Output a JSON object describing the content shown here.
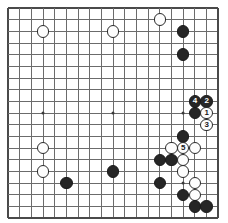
{
  "diagram": {
    "board_size": 19,
    "geometry": {
      "origin_x": 8,
      "origin_y": 8,
      "spacing": 11.67,
      "stone_radius": 6.2,
      "line_color": "#6b6b6b",
      "edge_color": "#4a4a4a",
      "board_color": "#ffffff",
      "black_color": "#262626",
      "white_color": "#fdfdfd",
      "hoshi_color": "#3a3a3a"
    },
    "hoshi_points": [
      {
        "col": 3,
        "row": 9
      },
      {
        "col": 9,
        "row": 9
      },
      {
        "col": 15,
        "row": 9
      },
      {
        "col": 15,
        "row": 15
      }
    ],
    "stones": [
      {
        "id": "s1",
        "color": "black",
        "col": 15,
        "row": 2,
        "label": ""
      },
      {
        "id": "s2",
        "color": "black",
        "col": 15,
        "row": 4,
        "label": ""
      },
      {
        "id": "s3",
        "color": "white",
        "col": 13,
        "row": 1,
        "label": ""
      },
      {
        "id": "s4",
        "color": "white",
        "col": 3,
        "row": 2,
        "label": ""
      },
      {
        "id": "s5",
        "color": "white",
        "col": 9,
        "row": 2,
        "label": ""
      },
      {
        "id": "s6",
        "color": "black",
        "col": 16,
        "row": 8,
        "label": "4"
      },
      {
        "id": "s7",
        "color": "black",
        "col": 17,
        "row": 8,
        "label": "2"
      },
      {
        "id": "s8",
        "color": "black",
        "col": 16,
        "row": 9,
        "label": ""
      },
      {
        "id": "s9",
        "color": "white",
        "col": 17,
        "row": 9,
        "label": "1"
      },
      {
        "id": "s10",
        "color": "white",
        "col": 17,
        "row": 10,
        "label": "3"
      },
      {
        "id": "s11",
        "color": "black",
        "col": 15,
        "row": 11,
        "label": ""
      },
      {
        "id": "s12",
        "color": "white",
        "col": 14,
        "row": 12,
        "label": ""
      },
      {
        "id": "s13",
        "color": "white",
        "col": 15,
        "row": 12,
        "label": "5"
      },
      {
        "id": "s14",
        "color": "white",
        "col": 16,
        "row": 12,
        "label": ""
      },
      {
        "id": "s15",
        "color": "black",
        "col": 13,
        "row": 13,
        "label": ""
      },
      {
        "id": "s16",
        "color": "black",
        "col": 14,
        "row": 13,
        "label": ""
      },
      {
        "id": "s17",
        "color": "white",
        "col": 15,
        "row": 13,
        "label": ""
      },
      {
        "id": "s18",
        "color": "white",
        "col": 15,
        "row": 14,
        "label": ""
      },
      {
        "id": "s19",
        "color": "black",
        "col": 13,
        "row": 15,
        "label": ""
      },
      {
        "id": "s20",
        "color": "white",
        "col": 16,
        "row": 15,
        "label": ""
      },
      {
        "id": "s21",
        "color": "black",
        "col": 15,
        "row": 16,
        "label": ""
      },
      {
        "id": "s22",
        "color": "white",
        "col": 16,
        "row": 16,
        "label": ""
      },
      {
        "id": "s23",
        "color": "black",
        "col": 16,
        "row": 17,
        "label": ""
      },
      {
        "id": "s24",
        "color": "black",
        "col": 17,
        "row": 17,
        "label": ""
      },
      {
        "id": "s25",
        "color": "white",
        "col": 3,
        "row": 12,
        "label": ""
      },
      {
        "id": "s26",
        "color": "white",
        "col": 3,
        "row": 14,
        "label": ""
      },
      {
        "id": "s27",
        "color": "black",
        "col": 5,
        "row": 15,
        "label": ""
      },
      {
        "id": "s28",
        "color": "black",
        "col": 9,
        "row": 14,
        "label": ""
      }
    ]
  }
}
